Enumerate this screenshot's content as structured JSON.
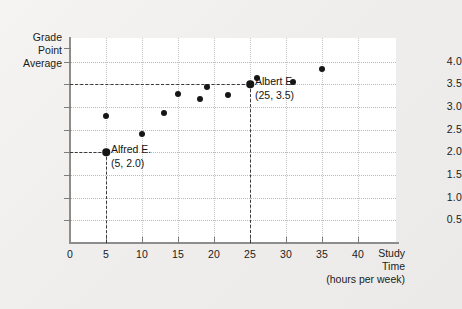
{
  "chart_data": {
    "type": "scatter",
    "title": "",
    "xlabel": "Study Time (hours per week)",
    "ylabel": "Grade Point Average",
    "xlabel_lines": [
      "Study",
      "Time",
      "(hours per week)"
    ],
    "ylabel_lines": [
      "Grade",
      "Point",
      "Average"
    ],
    "xlim": [
      0,
      41.5
    ],
    "ylim": [
      0,
      4.3
    ],
    "xticks": [
      0,
      5,
      10,
      15,
      20,
      25,
      30,
      35,
      40
    ],
    "xtick_labels": [
      "0",
      "5",
      "10",
      "15",
      "20",
      "25",
      "30",
      "35",
      "40"
    ],
    "yticks": [
      0.5,
      1.0,
      1.5,
      2.0,
      2.5,
      3.0,
      3.5,
      4.0
    ],
    "ytick_labels": [
      "0.5",
      "1.0",
      "1.5",
      "2.0",
      "2.5",
      "3.0",
      "3.5",
      "4.0"
    ],
    "grid": true,
    "legend": "none",
    "points": [
      {
        "x": 5,
        "y": 2.0,
        "highlight": true,
        "label": "Alfred E."
      },
      {
        "x": 5,
        "y": 2.8,
        "highlight": false,
        "label": ""
      },
      {
        "x": 10,
        "y": 2.4,
        "highlight": false,
        "label": ""
      },
      {
        "x": 13,
        "y": 2.88,
        "highlight": false,
        "label": ""
      },
      {
        "x": 15,
        "y": 3.28,
        "highlight": false,
        "label": ""
      },
      {
        "x": 18,
        "y": 3.17,
        "highlight": false,
        "label": ""
      },
      {
        "x": 19,
        "y": 3.45,
        "highlight": false,
        "label": ""
      },
      {
        "x": 22,
        "y": 3.27,
        "highlight": false,
        "label": ""
      },
      {
        "x": 25,
        "y": 3.5,
        "highlight": true,
        "label": "Albert E."
      },
      {
        "x": 26,
        "y": 3.65,
        "highlight": false,
        "label": ""
      },
      {
        "x": 31,
        "y": 3.55,
        "highlight": false,
        "label": ""
      },
      {
        "x": 35,
        "y": 3.84,
        "highlight": false,
        "label": ""
      }
    ],
    "annotations": [
      {
        "name": "alfred",
        "name_text": "Alfred E.",
        "coord_text": "(5, 2.0)",
        "x": 5,
        "y": 2.0
      },
      {
        "name": "albert",
        "name_text": "Albert E.",
        "coord_text": "(25, 3.5)",
        "x": 25,
        "y": 3.5
      }
    ],
    "guides": [
      {
        "name": "alfred-horizontal",
        "orientation": "h",
        "value": 2.0,
        "from": 0,
        "to": 5
      },
      {
        "name": "alfred-vertical",
        "orientation": "v",
        "value": 5,
        "from": 0,
        "to": 2.0
      },
      {
        "name": "albert-horizontal",
        "orientation": "h",
        "value": 3.5,
        "from": 0,
        "to": 25
      },
      {
        "name": "albert-vertical",
        "orientation": "v",
        "value": 25,
        "from": 0,
        "to": 3.5
      }
    ],
    "colors": {
      "marker": "#161616",
      "axis": "#8d8d8d",
      "grid": "#bdbdbd",
      "guide": "#3a3a3a",
      "panel": "#ffffff",
      "background": "#efeeec",
      "text": "#161616"
    }
  }
}
